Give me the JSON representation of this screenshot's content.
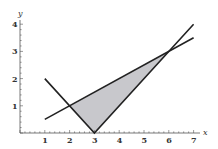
{
  "chart_data": {
    "type": "line",
    "title": "",
    "xlabel": "x",
    "ylabel": "y",
    "xlim": [
      0,
      7.3
    ],
    "ylim": [
      0,
      4.2
    ],
    "x_ticks": [
      1,
      2,
      3,
      4,
      5,
      6,
      7
    ],
    "y_ticks": [
      1,
      2,
      3,
      4
    ],
    "grid": false,
    "legend": null,
    "series": [
      {
        "name": "y = |x - 3|",
        "points": [
          [
            1,
            2
          ],
          [
            3,
            0
          ],
          [
            7,
            4
          ]
        ]
      },
      {
        "name": "y = x/2",
        "points": [
          [
            1,
            0.5
          ],
          [
            7,
            3.5
          ]
        ]
      }
    ],
    "shaded_region": {
      "description": "region between y=|x-3| (below) and y=x/2 (above)",
      "vertices": [
        [
          2,
          1
        ],
        [
          3,
          0
        ],
        [
          6,
          3
        ]
      ],
      "color": "#c8c8cc"
    },
    "intersections": [
      [
        2,
        1
      ],
      [
        6,
        3
      ]
    ]
  },
  "labels": {
    "x_axis": "x",
    "y_axis": "y",
    "x_ticks": [
      "1",
      "2",
      "3",
      "4",
      "5",
      "6",
      "7"
    ],
    "y_ticks": [
      "1",
      "2",
      "3",
      "4"
    ]
  },
  "colors": {
    "line": "#222222",
    "shade": "#c8c8cc",
    "axis": "#555555"
  }
}
